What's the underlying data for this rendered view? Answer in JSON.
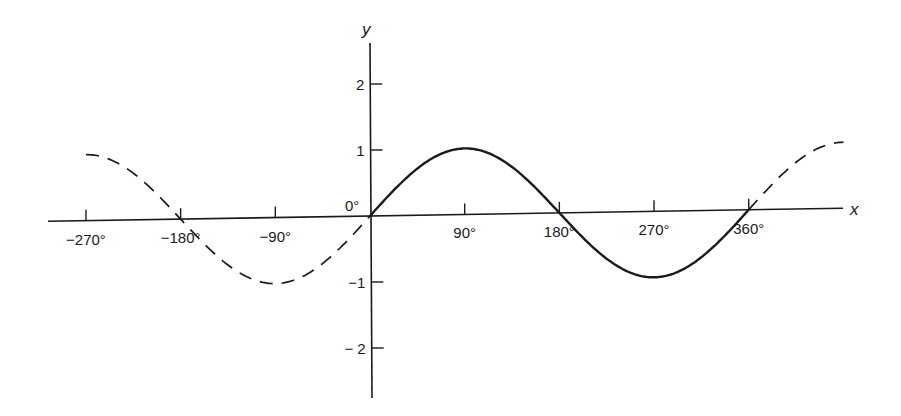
{
  "figure": {
    "x_axis_label": "x",
    "y_axis_label": "y",
    "origin_label": "0°",
    "x_ticks": [
      {
        "value": -270,
        "label": "−270°"
      },
      {
        "value": -180,
        "label": "−180°"
      },
      {
        "value": -90,
        "label": "−90°"
      },
      {
        "value": 90,
        "label": "90°"
      },
      {
        "value": 180,
        "label": "180°"
      },
      {
        "value": 270,
        "label": "270°"
      },
      {
        "value": 360,
        "label": "360°"
      }
    ],
    "y_ticks": [
      {
        "value": 2,
        "label": "2"
      },
      {
        "value": 1,
        "label": "1"
      },
      {
        "value": -1,
        "label": "−1"
      },
      {
        "value": -2,
        "label": "− 2"
      }
    ],
    "curve": {
      "function": "sin(x)",
      "solid_range_deg": [
        0,
        360
      ],
      "dashed_range_deg": [
        [
          -270,
          0
        ],
        [
          360,
          450
        ]
      ]
    },
    "colors": {
      "ink": "#1a1a1a",
      "background": "#ffffff"
    }
  },
  "chart_data": {
    "type": "line",
    "title": "",
    "xlabel": "x",
    "ylabel": "y",
    "x_unit": "degrees",
    "xlim": [
      -270,
      450
    ],
    "ylim": [
      -2.5,
      2.5
    ],
    "grid": false,
    "legend": "none",
    "x_tick_labels": [
      "−270°",
      "−180°",
      "−90°",
      "0°",
      "90°",
      "180°",
      "270°",
      "360°"
    ],
    "y_tick_labels": [
      "−2",
      "−1",
      "1",
      "2"
    ],
    "series": [
      {
        "name": "y = sin x (one period, solid)",
        "style": "solid",
        "x": [
          0,
          45,
          90,
          135,
          180,
          225,
          270,
          315,
          360
        ],
        "y": [
          0,
          0.71,
          1,
          0.71,
          0,
          -0.71,
          -1,
          -0.71,
          0
        ]
      },
      {
        "name": "y = sin x (extension, dashed)",
        "style": "dashed",
        "x": [
          -270,
          -225,
          -180,
          -135,
          -90,
          -45,
          0,
          360,
          405,
          450
        ],
        "y": [
          1,
          0.71,
          0,
          -0.71,
          -1,
          -0.71,
          0,
          0,
          0.71,
          1
        ]
      }
    ]
  }
}
